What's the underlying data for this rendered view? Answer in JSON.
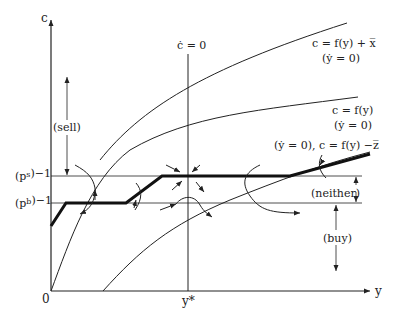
{
  "axes": {
    "y_axis_label": "c",
    "x_axis_label": "y",
    "origin_label": "0",
    "y_star_label": "y*"
  },
  "price_levels": {
    "ps_label": "(p",
    "ps_sup": "s",
    "ps_exp": ")−1",
    "pb_label": "(p",
    "pb_sup": "b",
    "pb_exp": ")−1"
  },
  "vertical_locus": {
    "label": "ċ = 0"
  },
  "curves": [
    {
      "id": "top",
      "line1": "c = f(y) + x̅",
      "line2": "(ẏ = 0)"
    },
    {
      "id": "middle",
      "line1": "c = f(y)",
      "line2": "(ẏ = 0)"
    },
    {
      "id": "bottom",
      "line1": "(ẏ = 0), c = f(y) −z̅"
    }
  ],
  "regions": {
    "sell": "(sell)",
    "neither": "(neither)",
    "buy": "(buy)"
  },
  "colors": {
    "line": "#222222",
    "background": "#ffffff"
  }
}
